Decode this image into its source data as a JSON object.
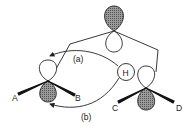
{
  "diagram": {
    "type": "orbital-interaction",
    "colors": {
      "line": "#222222",
      "shaded_fill": "#8a8a8a",
      "background": "#ffffff"
    },
    "labels": {
      "arrow_a": "(a)",
      "arrow_b": "(b)",
      "hydrogen": "H",
      "sub_A": "A",
      "sub_B": "B",
      "sub_C": "C",
      "sub_D": "D"
    },
    "orbitals": [
      {
        "name": "top-p-orbital",
        "shaded_lobe": "upper"
      },
      {
        "name": "left-p-orbital",
        "shaded_lobe": "lower",
        "substituents": [
          "A",
          "B"
        ]
      },
      {
        "name": "right-p-orbital",
        "shaded_lobe": "lower",
        "substituents": [
          "C",
          "D"
        ]
      }
    ],
    "arrows": [
      {
        "label": "(a)",
        "from": "H",
        "to": "left-p-orbital upper lobe"
      },
      {
        "label": "(b)",
        "from": "H",
        "to": "left-p-orbital lower lobe"
      }
    ]
  }
}
